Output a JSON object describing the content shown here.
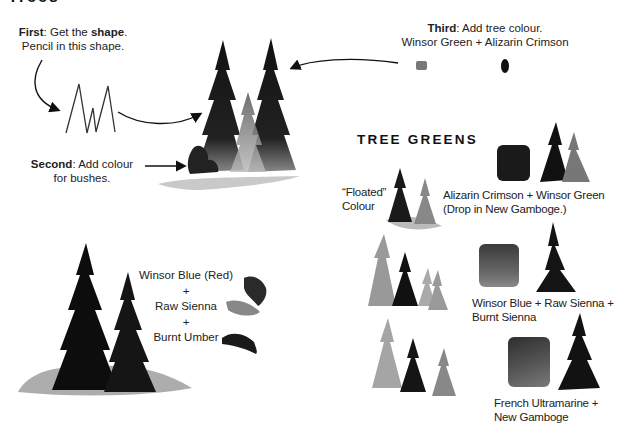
{
  "page": {
    "top_title_cut": "Trees"
  },
  "steps": {
    "first": {
      "label": "First",
      "text1": ": Get the ",
      "bold2": "shape",
      "text2": ".",
      "line2": "Pencil in this shape."
    },
    "second": {
      "label": "Second",
      "text1": ": Add colour",
      "line2": "for bushes."
    },
    "third": {
      "label": "Third",
      "text1": ": Add tree colour.",
      "line2": "Winsor Green + Alizarin Crimson"
    }
  },
  "mix_left": {
    "line1": "Winsor Blue (Red)",
    "plus1": "+",
    "line2": "Raw Sienna",
    "plus2": "+",
    "line3": "Burnt Umber"
  },
  "tree_greens": {
    "heading": "TREE GREENS",
    "floated_label_1": "“Floated”",
    "floated_label_2": "Colour",
    "swatches": [
      {
        "line1": "Alizarin Crimson + Winsor Green",
        "line2": "(Drop in New Gamboge.)",
        "color": "#1a1a1a"
      },
      {
        "line1": "Winsor Blue + Raw Sienna +",
        "line2": "Burnt Sienna",
        "color": "#4a4a4a"
      },
      {
        "line1": "French Ultramarine +",
        "line2": "New Gamboge",
        "color": "#3a3a3a"
      }
    ]
  },
  "colors": {
    "ink": "#111111",
    "wash_light": "#b5b5b5",
    "wash_mid": "#7a7a7a"
  }
}
